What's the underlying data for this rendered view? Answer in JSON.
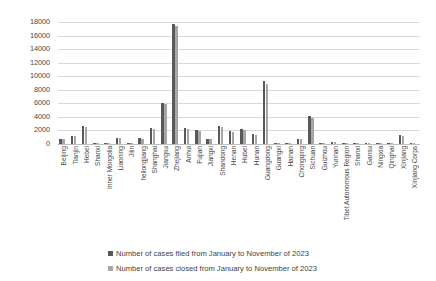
{
  "chart_data": {
    "type": "bar",
    "title": "",
    "xlabel": "",
    "ylabel": "",
    "ylim": [
      0,
      18000
    ],
    "ytick_step": 2000,
    "yticks": [
      18000,
      16000,
      14000,
      12000,
      10000,
      8000,
      6000,
      4000,
      2000,
      0
    ],
    "grid": true,
    "legend_position": "bottom",
    "colors": {
      "filed": "#595959",
      "closed": "#a6a6a6",
      "gridline": "#d9d9d9",
      "background": "#ffffff",
      "text": "#3f3f3f"
    },
    "categories": [
      "Beijing",
      "Tianjin",
      "Hebei",
      "Shanxi",
      "Inner Mongolia",
      "Liaoning",
      "Jilin",
      "heilongjiang",
      "Shanghai",
      "Jiangsu",
      "Zhejiang",
      "Anhui",
      "Fujian",
      "Jiangxi",
      "Shandong",
      "Henan",
      "Hubei",
      "Hunan",
      "Guangdong",
      "Guangxi",
      "Hainan",
      "Chongqing",
      "Sichuan",
      "Guizhou",
      "Yunnan",
      "Tibet Autonomous Region",
      "Shanxi",
      "Gansu",
      "Ningxia",
      "Qinghai",
      "Xinjiang",
      "Xinjiang Corps"
    ],
    "series": [
      {
        "name": "Number of cases filed from January to November of 2023",
        "key": "filed",
        "values": [
          750,
          1250,
          2600,
          60,
          170,
          960,
          190,
          880,
          2320,
          6080,
          17680,
          2370,
          2060,
          800,
          2680,
          1930,
          2250,
          1470,
          9350,
          40,
          110,
          740,
          4120,
          130,
          300,
          20,
          170,
          210,
          40,
          30,
          1320,
          25
        ]
      },
      {
        "name": "Number of cases closed from January to November of 2023",
        "key": "closed",
        "values": [
          690,
          1190,
          2480,
          50,
          150,
          900,
          170,
          800,
          2220,
          5880,
          17400,
          2280,
          1980,
          730,
          2570,
          1830,
          2140,
          1380,
          8900,
          35,
          95,
          690,
          3900,
          115,
          270,
          15,
          150,
          190,
          35,
          25,
          1250,
          20
        ]
      }
    ]
  },
  "legend": {
    "items": [
      {
        "label": "Number of cases filed from January to November of 2023",
        "color": "#595959"
      },
      {
        "label": "Number of cases closed from January to November of 2023",
        "color": "#a6a6a6"
      }
    ]
  }
}
